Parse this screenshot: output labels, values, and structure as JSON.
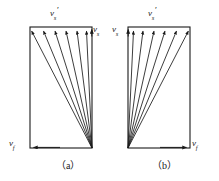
{
  "figure": {
    "background_color": "#ffffff",
    "stroke_color": "#1a1a1a",
    "panels": [
      {
        "id": "a",
        "caption": "（a）",
        "rect": {
          "x": 30,
          "y": 27,
          "width": 62,
          "height": 121
        },
        "convergence_corner": "bottom-right",
        "fan_ray_count": 6,
        "labels": {
          "top": {
            "base": "v",
            "sub": "s",
            "prime": "′",
            "text": "v s ′"
          },
          "side": {
            "base": "v",
            "sub": "s",
            "prime": "",
            "text": "v s"
          },
          "bottom": {
            "base": "v",
            "sub": "f",
            "prime": "",
            "text": "v f"
          }
        },
        "bottom_arrow_direction": "left",
        "side_arrow_direction": "up"
      },
      {
        "id": "b",
        "caption": "（b）",
        "rect": {
          "x": 128,
          "y": 27,
          "width": 62,
          "height": 121
        },
        "convergence_corner": "bottom-left",
        "fan_ray_count": 6,
        "labels": {
          "top": {
            "base": "v",
            "sub": "s",
            "prime": "′",
            "text": "v s ′"
          },
          "side": {
            "base": "v",
            "sub": "s",
            "prime": "",
            "text": "v s"
          },
          "bottom": {
            "base": "v",
            "sub": "f",
            "prime": "",
            "text": "v f"
          }
        },
        "bottom_arrow_direction": "right",
        "side_arrow_direction": "up"
      }
    ]
  },
  "labels": {
    "panel_a_top_base": "v",
    "panel_a_top_sub": "s",
    "panel_a_top_prime": "′",
    "panel_a_right_base": "v",
    "panel_a_right_sub": "s",
    "panel_a_bottom_base": "v",
    "panel_a_bottom_sub": "f",
    "panel_b_top_base": "v",
    "panel_b_top_sub": "s",
    "panel_b_top_prime": "′",
    "panel_b_left_base": "v",
    "panel_b_left_sub": "s",
    "panel_b_bottom_base": "v",
    "panel_b_bottom_sub": "f",
    "caption_a": "（a）",
    "caption_b": "（b）"
  }
}
